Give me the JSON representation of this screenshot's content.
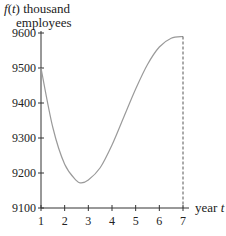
{
  "chart_data": {
    "type": "line",
    "title": "",
    "ylabel_line1": "f(t) thousand",
    "ylabel_line2": "employees",
    "xlabel": "year t",
    "xlim": [
      1,
      7
    ],
    "ylim": [
      9100,
      9600
    ],
    "x_ticks": [
      1,
      2,
      3,
      4,
      5,
      6,
      7
    ],
    "y_ticks": [
      9100,
      9200,
      9300,
      9400,
      9500,
      9600
    ],
    "grid": false,
    "legend": null,
    "series": [
      {
        "name": "f(t)",
        "x": [
          1,
          1.5,
          2,
          2.5,
          2.7,
          3,
          3.5,
          4,
          4.5,
          5,
          5.5,
          6,
          6.5,
          7
        ],
        "values": [
          9500,
          9330,
          9225,
          9178,
          9172,
          9180,
          9215,
          9280,
          9360,
          9440,
          9510,
          9560,
          9585,
          9590
        ]
      }
    ],
    "annotations": [
      {
        "type": "dashed-vertical-line",
        "x": 7,
        "from": 9100,
        "to": 9590
      }
    ],
    "colors": {
      "curve": "#9a9a9a",
      "axis": "#333333"
    }
  }
}
